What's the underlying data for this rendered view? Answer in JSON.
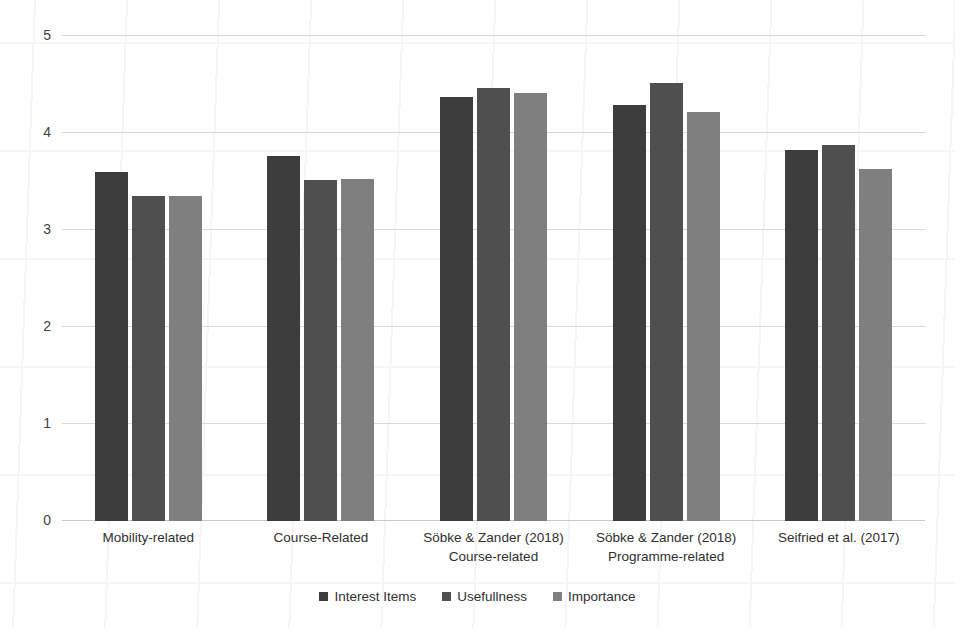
{
  "chart_data": {
    "type": "bar",
    "title": "",
    "subtitle": "",
    "xlabel": "",
    "ylabel": "",
    "ylim": [
      0,
      5
    ],
    "yticks": [
      0,
      1,
      2,
      3,
      4,
      5
    ],
    "ytick_labels": [
      "0",
      "1",
      "2",
      "3",
      "4",
      "5"
    ],
    "grid": true,
    "grid_axis": "y",
    "legend_position": "bottom",
    "categories": [
      "Mobility-related",
      "Course-Related",
      "Söbke & Zander (2018) Course-related",
      "Söbke & Zander (2018) Programme-related",
      "Seifried et al. (2017)"
    ],
    "category_lines": [
      [
        "Mobility-related",
        ""
      ],
      [
        "Course-Related",
        ""
      ],
      [
        "Söbke & Zander (2018)",
        "Course-related"
      ],
      [
        "Söbke & Zander (2018)",
        "Programme-related"
      ],
      [
        "Seifried et al. (2017)",
        ""
      ]
    ],
    "series": [
      {
        "name": "Interest Items",
        "color": "#3d3d3d",
        "values": [
          3.6,
          3.76,
          4.37,
          4.29,
          3.82
        ]
      },
      {
        "name": "Usefullness",
        "color": "#4f4f4f",
        "values": [
          3.35,
          3.52,
          4.46,
          4.52,
          3.88
        ]
      },
      {
        "name": "Importance",
        "color": "#7f7f7f",
        "values": [
          3.35,
          3.53,
          4.41,
          4.22,
          3.63
        ]
      }
    ]
  },
  "legend": {
    "items": [
      {
        "label": "Interest Items",
        "color": "#3d3d3d"
      },
      {
        "label": "Usefullness",
        "color": "#4f4f4f"
      },
      {
        "label": "Importance",
        "color": "#7f7f7f"
      }
    ]
  }
}
